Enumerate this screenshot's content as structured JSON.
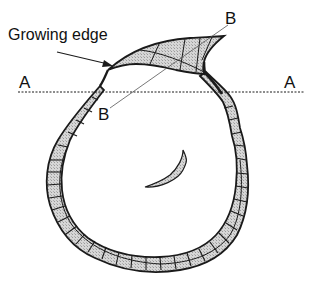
{
  "figure": {
    "labels": {
      "growing_edge": "Growing edge",
      "section_a_left": "A",
      "section_a_right": "A",
      "section_b_top": "B",
      "section_b_bottom": "B"
    },
    "colors": {
      "outline": "#1a1a1a",
      "fill": "#c8c8c8",
      "background": "#ffffff"
    }
  }
}
